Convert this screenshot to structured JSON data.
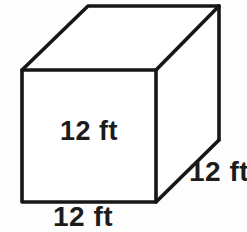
{
  "figure": {
    "shape": "cube",
    "background_color": "#fdfdfd",
    "line_color": "#161616",
    "face_color": "#ffffff"
  },
  "labels": {
    "height": "12 ft",
    "width": "12 ft",
    "depth": "12 ft"
  },
  "geometry": {
    "front_face": {
      "top_left": "22,70",
      "top_right": "156,70",
      "bottom_right": "156,202",
      "bottom_left": "22,202"
    },
    "back_face": {
      "top_left": "88,6",
      "top_right": "219,6",
      "bottom_right": "219,140"
    }
  }
}
